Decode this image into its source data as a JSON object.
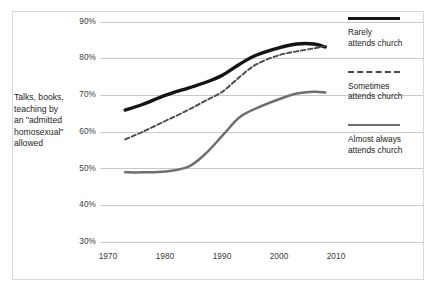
{
  "figure": {
    "axis_caption_lines": [
      "Talks, books,",
      "teaching by",
      "an \"admitted",
      "homosexual\"",
      "allowed"
    ]
  },
  "legend": {
    "entries": [
      {
        "swatch": "thick-solid-black-line-icon",
        "line1": "Rarely",
        "line2": "attends church"
      },
      {
        "swatch": "dashed-gray-line-icon",
        "line1": "Sometimes",
        "line2": "attends church"
      },
      {
        "swatch": "solid-gray-line-icon",
        "line1": "Almost always",
        "line2": "attends church"
      }
    ]
  },
  "yticks": [
    "90%",
    "80%",
    "70%",
    "60%",
    "50%",
    "40%",
    "30%"
  ],
  "xticks": [
    "1970",
    "1980",
    "1990",
    "2000",
    "2010"
  ],
  "colors": {
    "rarely": "#141414",
    "sometimes": "#4a4a4a",
    "almost_always": "#6f6f6f",
    "gridline": "#c9c9c9",
    "border": "#d9d9d9",
    "text": "#231f20"
  },
  "chart_data": {
    "type": "line",
    "title": "",
    "subtitle": "",
    "xlabel": "",
    "ylabel": "Talks, books, teaching by an \"admitted homosexual\" allowed",
    "xlim": [
      1970,
      2010
    ],
    "ylim": [
      30,
      90
    ],
    "ytick_values": [
      90,
      80,
      70,
      60,
      50,
      40,
      30
    ],
    "xtick_values": [
      1970,
      1980,
      1990,
      2000,
      2010
    ],
    "grid": "horizontal",
    "legend_position": "right",
    "units": "percent",
    "series": [
      {
        "name": "Rarely attends church",
        "style": "thick-solid",
        "color": "#141414",
        "x": [
          1973,
          1976,
          1980,
          1984,
          1987,
          1990,
          1993,
          1996,
          2000,
          2003,
          2006,
          2008
        ],
        "values": [
          66,
          67.5,
          70,
          72,
          73.5,
          75.5,
          78.5,
          81,
          83,
          84,
          84,
          83.2
        ]
      },
      {
        "name": "Sometimes attends church",
        "style": "dashed",
        "color": "#4a4a4a",
        "x": [
          1973,
          1976,
          1980,
          1984,
          1987,
          1990,
          1993,
          1996,
          2000,
          2003,
          2006,
          2008
        ],
        "values": [
          58,
          60,
          63,
          66,
          68.5,
          71,
          75,
          78.5,
          81,
          82,
          82.8,
          83.5
        ]
      },
      {
        "name": "Almost always attends church",
        "style": "solid",
        "color": "#6f6f6f",
        "x": [
          1973,
          1976,
          1980,
          1984,
          1987,
          1990,
          1993,
          1996,
          2000,
          2003,
          2006,
          2008
        ],
        "values": [
          49,
          49,
          49.2,
          50.5,
          54,
          59,
          64,
          66.5,
          69,
          70.5,
          71,
          70.8
        ]
      }
    ]
  }
}
